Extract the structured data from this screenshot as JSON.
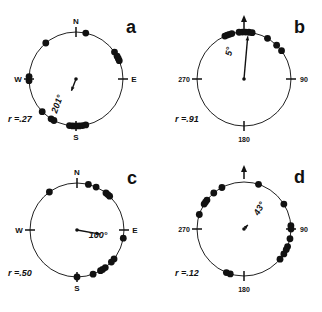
{
  "figure": {
    "panels": [
      {
        "id": "a",
        "letter": "a",
        "center": [
          76,
          79
        ],
        "radius": 47,
        "axis_labels": {
          "top": "N",
          "right": "E",
          "bottom": "S",
          "left": "W"
        },
        "axis_style": "compass",
        "north_arrow": false,
        "mean_angle_label": "201°",
        "mean_angle": 201,
        "r_label": "r =.27",
        "r": 0.27,
        "label_pos": [
          60,
          105
        ],
        "label_rot": -70,
        "r_pos": [
          8,
          122
        ],
        "dots": [
          12,
          320,
          55,
          61,
          64,
          67,
          268,
          273,
          226,
          212,
          208,
          188,
          184,
          180,
          176,
          172,
          168
        ]
      },
      {
        "id": "b",
        "letter": "b",
        "center": [
          244,
          79
        ],
        "radius": 47,
        "axis_labels": {
          "top": "",
          "right": "90",
          "bottom": "180",
          "left": "270"
        },
        "axis_style": "degrees",
        "north_arrow": true,
        "mean_angle_label": "5°",
        "mean_angle": 5,
        "r_label": "r =.91",
        "r": 0.91,
        "label_pos": [
          232,
          52
        ],
        "label_rot": -80,
        "r_pos": [
          175,
          122
        ],
        "dots": [
          -24,
          -21,
          -18,
          -15,
          -6,
          -2,
          2,
          6,
          10,
          30,
          44,
          53
        ]
      },
      {
        "id": "c",
        "letter": "c",
        "center": [
          77,
          230
        ],
        "radius": 47,
        "axis_labels": {
          "top": "N",
          "right": "E",
          "bottom": "S",
          "left": "W"
        },
        "axis_style": "compass",
        "north_arrow": false,
        "mean_angle_label": "100°",
        "mean_angle": 100,
        "r_label": "r =.50",
        "r": 0.5,
        "label_pos": [
          98,
          238
        ],
        "label_rot": 0,
        "r_pos": [
          8,
          276
        ],
        "dots": [
          -36,
          14,
          24,
          38,
          41,
          44,
          100,
          128,
          133,
          143,
          147,
          150,
          160,
          180
        ]
      },
      {
        "id": "d",
        "letter": "d",
        "center": [
          244,
          229
        ],
        "radius": 47,
        "axis_labels": {
          "top": "",
          "right": "90",
          "bottom": "180",
          "left": "270"
        },
        "axis_style": "degrees",
        "north_arrow": true,
        "mean_angle_label": "43°",
        "mean_angle": 43,
        "r_label": "r =.12",
        "r": 0.12,
        "label_pos": [
          262,
          210
        ],
        "label_rot": -60,
        "r_pos": [
          175,
          276
        ],
        "dots": [
          18,
          -28,
          -40,
          -52,
          -55,
          -58,
          -72,
          58,
          86,
          90,
          102,
          112,
          116,
          122,
          130,
          197,
          202
        ]
      }
    ]
  }
}
